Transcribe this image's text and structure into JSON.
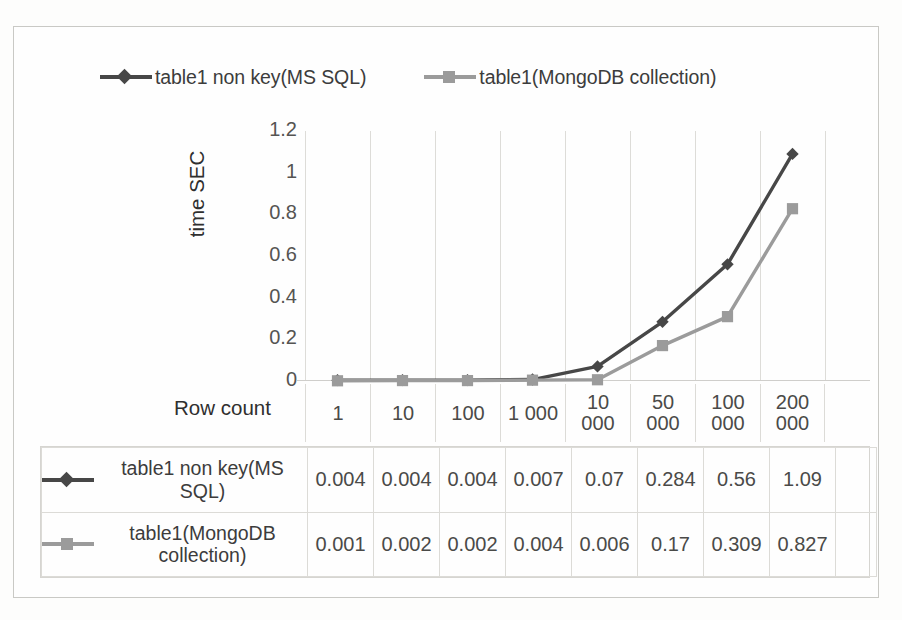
{
  "chart_data": {
    "type": "line",
    "title": "",
    "xlabel": "Row count",
    "ylabel": "time SEC",
    "categories": [
      "1",
      "10",
      "100",
      "1 000",
      "10 000",
      "50 000",
      "100 000",
      "200 000"
    ],
    "category_lines": [
      [
        "1"
      ],
      [
        "10"
      ],
      [
        "100"
      ],
      [
        "1 000"
      ],
      [
        "10",
        "000"
      ],
      [
        "50",
        "000"
      ],
      [
        "100",
        "000"
      ],
      [
        "200",
        "000"
      ]
    ],
    "yticks": [
      "0",
      "0.2",
      "0.4",
      "0.6",
      "0.8",
      "1",
      "1.2"
    ],
    "ytick_values": [
      0,
      0.2,
      0.4,
      0.6,
      0.8,
      1,
      1.2
    ],
    "ylim": [
      0,
      1.2
    ],
    "grid": "vertical",
    "legend_position": "top",
    "series": [
      {
        "name": "table1 non key(MS SQL)",
        "marker": "diamond",
        "color": "#474747",
        "values": [
          0.004,
          0.004,
          0.004,
          0.007,
          0.07,
          0.284,
          0.56,
          1.09
        ],
        "value_labels": [
          "0.004",
          "0.004",
          "0.004",
          "0.007",
          "0.07",
          "0.284",
          "0.56",
          "1.09"
        ]
      },
      {
        "name": "table1(MongoDB collection)",
        "marker": "square",
        "color": "#9b9b9b",
        "values": [
          0.001,
          0.002,
          0.002,
          0.004,
          0.006,
          0.17,
          0.309,
          0.827
        ],
        "value_labels": [
          "0.001",
          "0.002",
          "0.002",
          "0.004",
          "0.006",
          "0.17",
          "0.309",
          "0.827"
        ]
      }
    ]
  },
  "legend": {
    "entries": [
      {
        "label": "table1 non key(MS SQL)",
        "color": "#474747",
        "marker": "diamond"
      },
      {
        "label": "table1(MongoDB collection)",
        "color": "#9b9b9b",
        "marker": "square"
      }
    ]
  },
  "axis": {
    "y_title": "time SEC",
    "x_title": "Row count"
  },
  "colors": {
    "series_dark": "#474747",
    "series_light": "#9b9b9b",
    "gridline": "#dddcd8",
    "text": "#3c3c3c",
    "page_background": "#fdfdfc"
  }
}
